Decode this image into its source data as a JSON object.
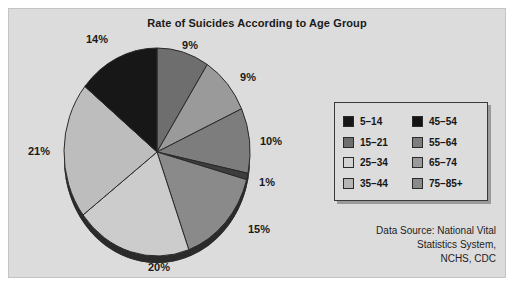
{
  "chart_data": {
    "type": "pie",
    "title": "Rate of Suicides According to Age Group",
    "categories": [
      "5–14",
      "15–21",
      "25–34",
      "35–44",
      "45–54",
      "55–64",
      "65–74",
      "75–85+"
    ],
    "slices": [
      {
        "label": "9%",
        "value": 9,
        "color": "#6e6e6e",
        "label_x": 181,
        "label_y": 40
      },
      {
        "label": "9%",
        "value": 9,
        "color": "#9a9a9a",
        "label_x": 239,
        "label_y": 72
      },
      {
        "label": "10%",
        "value": 10,
        "color": "#7d7d7d",
        "label_x": 262,
        "label_y": 136
      },
      {
        "label": "1%",
        "value": 1,
        "color": "#3d3d3d",
        "label_x": 258,
        "label_y": 177
      },
      {
        "label": "15%",
        "value": 15,
        "color": "#8a8a8a",
        "label_x": 250,
        "label_y": 224
      },
      {
        "label": "20%",
        "value": 20,
        "color": "#cccccc",
        "label_x": 150,
        "label_y": 262
      },
      {
        "label": "21%",
        "value": 21,
        "color": "#bdbdbd",
        "label_x": 30,
        "label_y": 146
      },
      {
        "label": "14%",
        "value": 14,
        "color": "#171717",
        "label_x": 88,
        "label_y": 34
      }
    ],
    "start_angle_deg": 0,
    "legend_position": "right",
    "grid": false,
    "xlabel": "",
    "ylabel": ""
  },
  "legend": {
    "entries": [
      {
        "label": "5–14",
        "color": "#171717"
      },
      {
        "label": "45–54",
        "color": "#141414"
      },
      {
        "label": "15–21",
        "color": "#6e6e6e"
      },
      {
        "label": "55–64",
        "color": "#7d7d7d"
      },
      {
        "label": "25–34",
        "color": "#d2d2d2"
      },
      {
        "label": "65–74",
        "color": "#9a9a9a"
      },
      {
        "label": "35–44",
        "color": "#b5b5b5"
      },
      {
        "label": "75–85+",
        "color": "#8a8a8a"
      }
    ]
  },
  "data_source": {
    "line1": "Data Source: National Vital",
    "line2": "Statistics System,",
    "line3": "NCHS, CDC"
  },
  "geometry": {
    "cx": 148,
    "cy": 143,
    "rx": 93,
    "ry": 104,
    "depth": 7,
    "rim_color": "#2b2b2b",
    "edge_color": "#2a2a2a"
  }
}
